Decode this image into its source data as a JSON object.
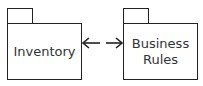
{
  "diagram": {
    "packages": [
      {
        "label": "Inventory"
      },
      {
        "label": "Business\nRules"
      }
    ],
    "connector": {
      "type": "bidirectional-dependency",
      "from": "Business Rules",
      "to": "Inventory"
    }
  }
}
